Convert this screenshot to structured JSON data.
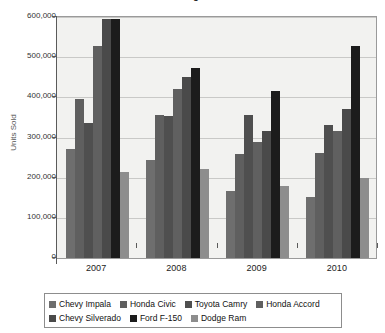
{
  "chart_data": {
    "type": "bar",
    "title": "Annual Best-Selling Cars and Trucks",
    "xlabel": "",
    "ylabel": "Units Sold",
    "categories": [
      "2007",
      "2008",
      "2009",
      "2010"
    ],
    "ylim": [
      0,
      600000
    ],
    "yticks": [
      0,
      100000,
      200000,
      300000,
      400000,
      500000,
      600000
    ],
    "ytick_labels": [
      "0",
      "100,000",
      "200,000",
      "300,000",
      "400,000",
      "500,000",
      "600,000"
    ],
    "grid": true,
    "legend_position": "bottom",
    "series": [
      {
        "name": "Chevy Impala",
        "color": "#6e6e6e",
        "values": [
          272000,
          245000,
          166000,
          152000
        ]
      },
      {
        "name": "Honda Civic",
        "color": "#5f5f5f",
        "values": [
          396000,
          355000,
          258000,
          261000
        ]
      },
      {
        "name": "Toyota Camry",
        "color": "#4f4f4f",
        "values": [
          336000,
          353000,
          357000,
          330000
        ]
      },
      {
        "name": "Honda Accord",
        "color": "#606060",
        "values": [
          527000,
          420000,
          290000,
          316000
        ]
      },
      {
        "name": "Chevy Silverado",
        "color": "#4a4a4a",
        "values": [
          595000,
          450000,
          315000,
          372000
        ]
      },
      {
        "name": "Ford F-150",
        "color": "#1c1c1c",
        "values": [
          595000,
          472000,
          415000,
          529000
        ]
      },
      {
        "name": "Dodge Ram",
        "color": "#8d8d8d",
        "values": [
          215000,
          222000,
          180000,
          198000
        ]
      }
    ]
  }
}
